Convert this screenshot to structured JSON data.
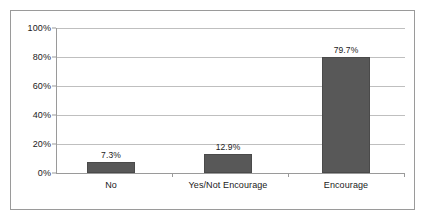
{
  "chart_data": {
    "type": "bar",
    "title": "",
    "subtitle": "",
    "xlabel": "",
    "ylabel": "",
    "categories": [
      "No",
      "Yes/Not Encourage",
      "Encourage"
    ],
    "values": [
      7.3,
      12.9,
      79.7
    ],
    "value_labels": [
      "7.3%",
      "12.9%",
      "79.7%"
    ],
    "series": [
      {
        "name": "",
        "values": [
          7.3,
          12.9,
          79.7
        ]
      }
    ],
    "ylim": [
      0,
      100
    ],
    "yticks": [
      0,
      20,
      40,
      60,
      80,
      100
    ],
    "ytick_labels": [
      "0%",
      "20%",
      "40%",
      "60%",
      "80%",
      "100%"
    ],
    "grid": true,
    "legend": false,
    "legend_position": "none",
    "bar_color": "#585858",
    "gridline_color": "#bfbfbf",
    "axis_color": "#9a9a9a",
    "frame_color": "#9a9a9a",
    "background_color": "#ffffff",
    "text_color": "#1a1a1a"
  }
}
